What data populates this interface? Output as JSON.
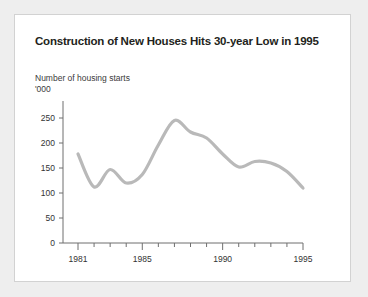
{
  "chart_data": {
    "type": "line",
    "title": "Construction of New Houses Hits 30-year Low in 1995",
    "ylabel_line1": "Number of housing starts",
    "ylabel_line2": "'000",
    "xlabel": "",
    "x": [
      1981,
      1982,
      1983,
      1984,
      1985,
      1986,
      1987,
      1988,
      1989,
      1990,
      1991,
      1992,
      1993,
      1994,
      1995
    ],
    "values": [
      178,
      112,
      147,
      120,
      137,
      196,
      245,
      222,
      210,
      178,
      152,
      163,
      160,
      143,
      110
    ],
    "series": [
      {
        "name": "Housing starts",
        "values": [
          178,
          112,
          147,
          120,
          137,
          196,
          245,
          222,
          210,
          178,
          152,
          163,
          160,
          143,
          110
        ]
      }
    ],
    "categories": [
      "1981",
      "1982",
      "1983",
      "1984",
      "1985",
      "1986",
      "1987",
      "1988",
      "1989",
      "1990",
      "1991",
      "1992",
      "1993",
      "1994",
      "1995"
    ],
    "yticks": [
      0,
      50,
      100,
      150,
      200,
      250
    ],
    "xticks_labeled": [
      "1981",
      "1985",
      "1990",
      "1995"
    ],
    "xticks_all": [
      "1981",
      "1982",
      "1983",
      "1984",
      "1985",
      "1986",
      "1987",
      "1988",
      "1989",
      "1990",
      "1991",
      "1992",
      "1993",
      "1994",
      "1995"
    ],
    "ylim": [
      0,
      250
    ],
    "xlim": [
      1981,
      1995
    ],
    "grid": false,
    "legend": false,
    "smoothing": "spline",
    "line_color": "#b9b9b9",
    "axis_color": "#6f6f6f",
    "title_color": "#231f20",
    "panel_background": "#ffffff",
    "page_background": "#eeeeee"
  },
  "panel": {
    "title": "Construction of New Houses Hits 30-year Low in 1995",
    "caption_line1": "Number of housing starts",
    "caption_line2": "'000"
  }
}
